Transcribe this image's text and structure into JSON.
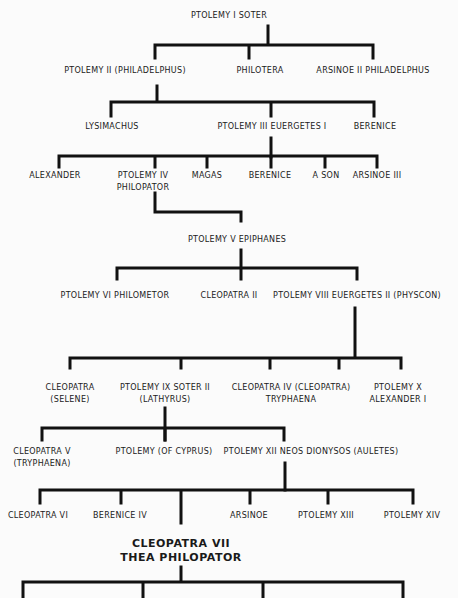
{
  "line_color": "#111111",
  "nodes": [
    {
      "id": "ptolemy-i",
      "lines": [
        "Ptolemy I Soter"
      ],
      "x": 229,
      "y": 10
    },
    {
      "id": "ptolemy-ii",
      "lines": [
        "Ptolemy II (Philadelphus)"
      ],
      "x": 125,
      "y": 65
    },
    {
      "id": "philotera",
      "lines": [
        "Philotera"
      ],
      "x": 260,
      "y": 65
    },
    {
      "id": "arsinoe-ii",
      "lines": [
        "Arsinoe II Philadelphus"
      ],
      "x": 373,
      "y": 65
    },
    {
      "id": "lysimachus",
      "lines": [
        "Lysimachus"
      ],
      "x": 112,
      "y": 121
    },
    {
      "id": "ptolemy-iii",
      "lines": [
        "Ptolemy III Euergetes I"
      ],
      "x": 272,
      "y": 121
    },
    {
      "id": "berenice",
      "lines": [
        "Berenice"
      ],
      "x": 375,
      "y": 121
    },
    {
      "id": "alexander",
      "lines": [
        "Alexander"
      ],
      "x": 55,
      "y": 170
    },
    {
      "id": "ptolemy-iv",
      "lines": [
        "Ptolemy IV",
        "Philopator"
      ],
      "x": 143,
      "y": 170
    },
    {
      "id": "magas",
      "lines": [
        "Magas"
      ],
      "x": 207,
      "y": 170
    },
    {
      "id": "berenice-2",
      "lines": [
        "Berenice"
      ],
      "x": 270,
      "y": 170
    },
    {
      "id": "a-son",
      "lines": [
        "A Son"
      ],
      "x": 326,
      "y": 170
    },
    {
      "id": "arsinoe-iii",
      "lines": [
        "Arsinoe III"
      ],
      "x": 377,
      "y": 170
    },
    {
      "id": "ptolemy-v",
      "lines": [
        "Ptolemy V Epiphanes"
      ],
      "x": 237,
      "y": 234
    },
    {
      "id": "ptolemy-vi",
      "lines": [
        "Ptolemy VI Philometor"
      ],
      "x": 115,
      "y": 290
    },
    {
      "id": "cleopatra-ii",
      "lines": [
        "Cleopatra II"
      ],
      "x": 229,
      "y": 290
    },
    {
      "id": "ptolemy-viii",
      "lines": [
        "Ptolemy VIII Euergetes II (Physcon)"
      ],
      "x": 357,
      "y": 290
    },
    {
      "id": "cleopatra-selene",
      "lines": [
        "Cleopatra",
        "(Selene)"
      ],
      "x": 70,
      "y": 382
    },
    {
      "id": "ptolemy-ix",
      "lines": [
        "Ptolemy IX Soter II",
        "(Lathyrus)"
      ],
      "x": 165,
      "y": 382
    },
    {
      "id": "cleopatra-iv",
      "lines": [
        "Cleopatra IV (Cleopatra)",
        "Tryphaena"
      ],
      "x": 291,
      "y": 382
    },
    {
      "id": "ptolemy-x",
      "lines": [
        "Ptolemy X",
        "Alexander I"
      ],
      "x": 398,
      "y": 382
    },
    {
      "id": "cleopatra-v",
      "lines": [
        "Cleopatra V",
        "(Tryphaena)"
      ],
      "x": 42,
      "y": 446
    },
    {
      "id": "ptolemy-cyprus",
      "lines": [
        "Ptolemy (of Cyprus)"
      ],
      "x": 164,
      "y": 446
    },
    {
      "id": "ptolemy-xii",
      "lines": [
        "Ptolemy XII Neos Dionysos (Auletes)"
      ],
      "x": 311,
      "y": 446
    },
    {
      "id": "cleopatra-vi",
      "lines": [
        "Cleopatra VI"
      ],
      "x": 38,
      "y": 510
    },
    {
      "id": "berenice-iv",
      "lines": [
        "Berenice IV"
      ],
      "x": 120,
      "y": 510
    },
    {
      "id": "arsinoe",
      "lines": [
        "Arsinoe"
      ],
      "x": 249,
      "y": 510
    },
    {
      "id": "ptolemy-xiii",
      "lines": [
        "Ptolemy XIII"
      ],
      "x": 326,
      "y": 510
    },
    {
      "id": "ptolemy-xiv",
      "lines": [
        "Ptolemy XIV"
      ],
      "x": 412,
      "y": 510
    },
    {
      "id": "cleopatra-vii",
      "lines": [
        "Cleopatra VII",
        "Thea Philopator"
      ],
      "x": 181,
      "y": 537,
      "main": true
    }
  ],
  "edges": [
    "M268 26 V43",
    "M155 45 H373 M155 45 V58 M249 45 V58 M373 45 V58",
    "M157 86 V100",
    "M111 102 H374 M111 102 V116 M271 102 V116 M374 102 V116",
    "M271 138 V157",
    "M59 156 H377 M59 156 V167 M155 156 V167 M207 156 V167 M271 156 V167 M325 156 V167 M377 156 V167",
    "M155 193 V212 H241 V221",
    "M241 250 V266",
    "M117 268 H357 M117 268 V279 M241 268 V279 M357 268 V279",
    "M355 308 V357",
    "M70 358 H401 M70 358 V368 M181 358 V368 M270 358 V368 M339 358 V368 M401 358 V368",
    "M165 408 V440",
    "M42 428 H284 M42 428 V440 M165 428 V440 M284 428 V440",
    "M285 463 V490",
    "M40 490 H413 M40 490 V503 M121 490 V503 M181 490 V523 M250 490 V503 M328 490 V503 M413 490 V503",
    "M181 567 V580",
    "M23 582 H403 M23 582 V598 M143 582 V598 M263 582 V598 M403 582 V598"
  ]
}
